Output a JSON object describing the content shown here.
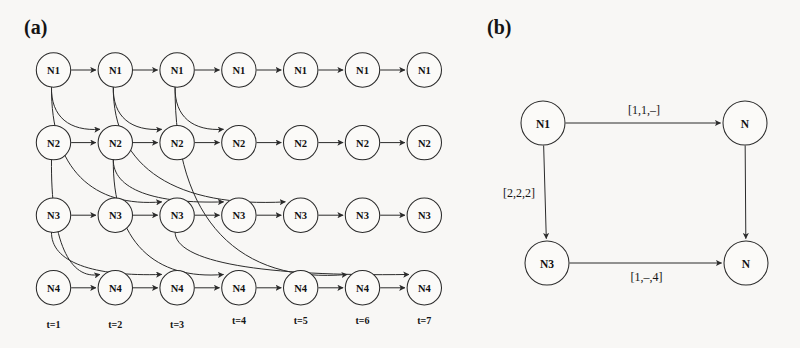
{
  "figure": {
    "background_color": "#f8f7f5",
    "stroke_color": "#2b2b2b",
    "width": 800,
    "height": 348
  },
  "panel_a": {
    "label": "(a)",
    "node_rows": [
      "N1",
      "N2",
      "N3",
      "N4"
    ],
    "time_labels": [
      "t=1",
      "t=2",
      "t=3",
      "t=4",
      "t=5",
      "t=6",
      "t=7"
    ],
    "nodes": [
      {
        "id": "N1-t1",
        "row": "N1",
        "t": 1,
        "label": "N1"
      },
      {
        "id": "N1-t2",
        "row": "N1",
        "t": 2,
        "label": "N1"
      },
      {
        "id": "N1-t3",
        "row": "N1",
        "t": 3,
        "label": "N1"
      },
      {
        "id": "N1-t4",
        "row": "N1",
        "t": 4,
        "label": "N1"
      },
      {
        "id": "N1-t5",
        "row": "N1",
        "t": 5,
        "label": "N1"
      },
      {
        "id": "N1-t6",
        "row": "N1",
        "t": 6,
        "label": "N1"
      },
      {
        "id": "N1-t7",
        "row": "N1",
        "t": 7,
        "label": "N1"
      },
      {
        "id": "N2-t1",
        "row": "N2",
        "t": 1,
        "label": "N2"
      },
      {
        "id": "N2-t2",
        "row": "N2",
        "t": 2,
        "label": "N2"
      },
      {
        "id": "N2-t3",
        "row": "N2",
        "t": 3,
        "label": "N2"
      },
      {
        "id": "N2-t4",
        "row": "N2",
        "t": 4,
        "label": "N2"
      },
      {
        "id": "N2-t5",
        "row": "N2",
        "t": 5,
        "label": "N2"
      },
      {
        "id": "N2-t6",
        "row": "N2",
        "t": 6,
        "label": "N2"
      },
      {
        "id": "N2-t7",
        "row": "N2",
        "t": 7,
        "label": "N2"
      },
      {
        "id": "N3-t1",
        "row": "N3",
        "t": 1,
        "label": "N3"
      },
      {
        "id": "N3-t2",
        "row": "N3",
        "t": 2,
        "label": "N3"
      },
      {
        "id": "N3-t3",
        "row": "N3",
        "t": 3,
        "label": "N3"
      },
      {
        "id": "N3-t4",
        "row": "N3",
        "t": 4,
        "label": "N3"
      },
      {
        "id": "N3-t5",
        "row": "N3",
        "t": 5,
        "label": "N3"
      },
      {
        "id": "N3-t6",
        "row": "N3",
        "t": 6,
        "label": "N3"
      },
      {
        "id": "N3-t7",
        "row": "N3",
        "t": 7,
        "label": "N3"
      },
      {
        "id": "N4-t1",
        "row": "N4",
        "t": 1,
        "label": "N4"
      },
      {
        "id": "N4-t2",
        "row": "N4",
        "t": 2,
        "label": "N4"
      },
      {
        "id": "N4-t3",
        "row": "N4",
        "t": 3,
        "label": "N4"
      },
      {
        "id": "N4-t4",
        "row": "N4",
        "t": 4,
        "label": "N4"
      },
      {
        "id": "N4-t5",
        "row": "N4",
        "t": 5,
        "label": "N4"
      },
      {
        "id": "N4-t6",
        "row": "N4",
        "t": 6,
        "label": "N4"
      },
      {
        "id": "N4-t7",
        "row": "N4",
        "t": 7,
        "label": "N4"
      }
    ],
    "horizontal_edges": [
      {
        "from": "N1-t1",
        "to": "N1-t2"
      },
      {
        "from": "N1-t2",
        "to": "N1-t3"
      },
      {
        "from": "N1-t3",
        "to": "N1-t4"
      },
      {
        "from": "N1-t4",
        "to": "N1-t5"
      },
      {
        "from": "N1-t5",
        "to": "N1-t6"
      },
      {
        "from": "N1-t6",
        "to": "N1-t7"
      },
      {
        "from": "N2-t1",
        "to": "N2-t2"
      },
      {
        "from": "N2-t2",
        "to": "N2-t3"
      },
      {
        "from": "N2-t3",
        "to": "N2-t4"
      },
      {
        "from": "N2-t4",
        "to": "N2-t5"
      },
      {
        "from": "N2-t5",
        "to": "N2-t6"
      },
      {
        "from": "N2-t6",
        "to": "N2-t7"
      },
      {
        "from": "N3-t1",
        "to": "N3-t2"
      },
      {
        "from": "N3-t2",
        "to": "N3-t3"
      },
      {
        "from": "N3-t3",
        "to": "N3-t4"
      },
      {
        "from": "N3-t4",
        "to": "N3-t5"
      },
      {
        "from": "N3-t5",
        "to": "N3-t6"
      },
      {
        "from": "N3-t6",
        "to": "N3-t7"
      },
      {
        "from": "N4-t1",
        "to": "N4-t2"
      },
      {
        "from": "N4-t2",
        "to": "N4-t3"
      },
      {
        "from": "N4-t3",
        "to": "N4-t4"
      },
      {
        "from": "N4-t4",
        "to": "N4-t5"
      },
      {
        "from": "N4-t5",
        "to": "N4-t6"
      },
      {
        "from": "N4-t6",
        "to": "N4-t7"
      }
    ],
    "curved_edges": [
      {
        "from": "N1-t1",
        "to": "N2-t2"
      },
      {
        "from": "N1-t1",
        "to": "N3-t3"
      },
      {
        "from": "N1-t2",
        "to": "N2-t3"
      },
      {
        "from": "N1-t2",
        "to": "N3-t5"
      },
      {
        "from": "N1-t3",
        "to": "N2-t4"
      },
      {
        "from": "N1-t3",
        "to": "N4-t6"
      },
      {
        "from": "N2-t1",
        "to": "N4-t2"
      },
      {
        "from": "N2-t2",
        "to": "N3-t4"
      },
      {
        "from": "N2-t2",
        "to": "N4-t4"
      },
      {
        "from": "N3-t1",
        "to": "N4-t3"
      },
      {
        "from": "N3-t3",
        "to": "N4-t7"
      }
    ]
  },
  "panel_b": {
    "label": "(b)",
    "nodes": [
      {
        "id": "b-N1",
        "label": "N1",
        "position": "top-left"
      },
      {
        "id": "b-Ntr",
        "label": "N",
        "position": "top-right"
      },
      {
        "id": "b-N3",
        "label": "N3",
        "position": "bottom-left"
      },
      {
        "id": "b-Nbr",
        "label": "N",
        "position": "bottom-right"
      }
    ],
    "edges": [
      {
        "from": "b-N1",
        "to": "b-Ntr",
        "label": "[1,1,–]",
        "label_position": "above"
      },
      {
        "from": "b-N1",
        "to": "b-N3",
        "label": "[2,2,2]",
        "label_position": "left"
      },
      {
        "from": "b-N3",
        "to": "b-Nbr",
        "label": "[1,–,4]",
        "label_position": "below"
      },
      {
        "from": "b-Ntr",
        "to": "b-Nbr",
        "label": "",
        "label_position": "none"
      }
    ]
  }
}
